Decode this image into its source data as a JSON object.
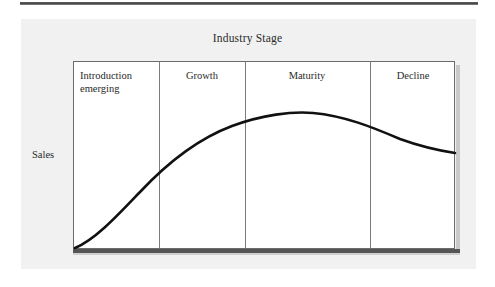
{
  "figure": {
    "title": "Industry Stage",
    "y_axis_label": "Sales"
  },
  "stages": [
    {
      "label": "Introduction\nemerging",
      "align": "left",
      "left": 80,
      "width": 76
    },
    {
      "label": "Growth",
      "align": "center",
      "left": 162,
      "width": 80
    },
    {
      "label": "Maturity",
      "align": "center",
      "left": 248,
      "width": 118
    },
    {
      "label": "Decline",
      "align": "center",
      "left": 374,
      "width": 78
    }
  ],
  "dividers": [
    159,
    245,
    370
  ],
  "chart_data": {
    "type": "line",
    "title": "Industry Stage",
    "xlabel": "Industry Stage",
    "ylabel": "Sales",
    "grid": false,
    "legend": "none",
    "categories": [
      "Introduction emerging",
      "Growth",
      "Maturity",
      "Decline"
    ],
    "category_boundaries": [
      0,
      22.5,
      45,
      77.8,
      100
    ],
    "xlim": [
      0,
      100
    ],
    "ylim": [
      0,
      100
    ],
    "series": [
      {
        "name": "Sales",
        "x": [
          0,
          5,
          10,
          15,
          20,
          25,
          30,
          35,
          40,
          45,
          50,
          55,
          60,
          65,
          70,
          75,
          80,
          85,
          90,
          95,
          100
        ],
        "y": [
          0,
          4,
          10,
          17,
          25,
          33,
          42,
          50,
          57,
          64,
          69,
          73,
          76,
          78,
          79,
          79,
          78,
          76,
          72,
          67,
          61
        ]
      }
    ],
    "annotations": [
      {
        "text": "Introduction emerging",
        "x": 8,
        "y": 95
      },
      {
        "text": "Growth",
        "x": 33,
        "y": 95
      },
      {
        "text": "Maturity",
        "x": 60,
        "y": 95
      },
      {
        "text": "Decline",
        "x": 89,
        "y": 95
      }
    ]
  },
  "curve": {
    "path": "M 75,248 C 95,240 118,215 140,192 C 170,160 200,138 232,126 C 262,115 292,111 313,113 C 345,116 372,127 400,139 C 422,147 442,151 455,153"
  },
  "colors": {
    "curve": "#111111",
    "frame": "#6b6b6b",
    "divider": "#7b7b7b",
    "panel_bg": "#f1f1f1",
    "plot_bg": "#ffffff",
    "text": "#2a2a2a",
    "top_rule": "#3a3a3a"
  }
}
